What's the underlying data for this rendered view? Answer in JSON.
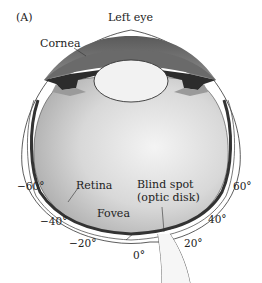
{
  "panel_label": "(A)",
  "title": "Left eye",
  "labels": {
    "cornea": "Cornea",
    "retina": "Retina",
    "fovea": "Fovea",
    "blind_spot_line1": "Blind spot",
    "blind_spot_line2": "(optic disk)"
  },
  "angles": {
    "neg60": "−60°",
    "neg40": "−40°",
    "neg20": "−20°",
    "zero": "0°",
    "pos20": "20°",
    "pos40": "40°",
    "pos60": "60°"
  },
  "colors": {
    "anterior_chamber": "#6e6e6e",
    "vitreous_light": "#f2f2f2",
    "vitreous_dark": "#b9b9b9",
    "retina_band": "#3a3a3a",
    "lens": "#f0f0f0",
    "iris": "#2c2c2c"
  }
}
